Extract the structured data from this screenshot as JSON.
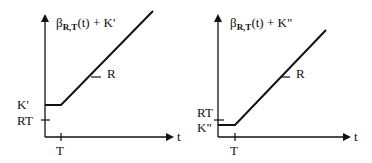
{
  "diagrams": [
    {
      "title_prefix": "β",
      "title_subscript": "R,T",
      "title_suffix": "(t) + K'",
      "x_axis_label": "t",
      "x_tick_label": "T",
      "y_tick_labels": [
        "K'",
        "RT"
      ],
      "slope_label": "R"
    },
    {
      "title_prefix": "β",
      "title_subscript": "R,T",
      "title_suffix": "(t) + K\"",
      "x_axis_label": "t",
      "x_tick_label": "T",
      "y_tick_labels": [
        "RT",
        "K\""
      ],
      "slope_label": "R"
    }
  ],
  "colors": {
    "ink": "#111111",
    "background": "#ffffff"
  }
}
